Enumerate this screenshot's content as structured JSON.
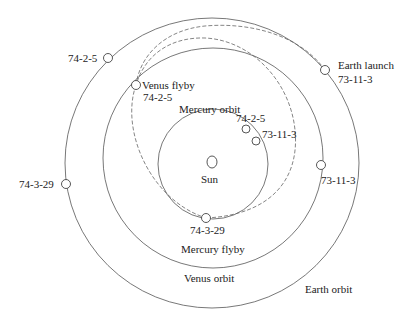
{
  "diagram": {
    "center": {
      "label": "Sun"
    },
    "orbits": [
      {
        "id": "earth",
        "label": "Earth orbit"
      },
      {
        "id": "venus",
        "label": "Venus orbit"
      },
      {
        "id": "mercury",
        "label": "Mercury orbit"
      }
    ],
    "transfer_arcs": [
      {
        "id": "earth-to-venus",
        "style": "dashed"
      },
      {
        "id": "venus-to-mercury",
        "style": "dashed"
      }
    ],
    "events": {
      "earth_launch": {
        "label": "Earth launch",
        "date": "73-11-3"
      },
      "venus_flyby": {
        "label": "Venus flyby",
        "date": "74-2-5"
      },
      "mercury_flyby": {
        "label": "Mercury flyby",
        "date": "74-3-29"
      }
    },
    "positions": {
      "earth_74_2_5": "74-2-5",
      "earth_74_3_29": "74-3-29",
      "venus_73_11_3": "73-11-3",
      "mercury_74_2_5": "74-2-5",
      "mercury_73_11_3": "73-11-3"
    }
  }
}
